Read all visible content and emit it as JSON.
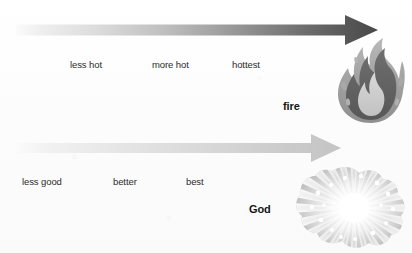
{
  "diagram": {
    "type": "comparison-scales",
    "background_color": "#fdfdfd",
    "width": 412,
    "height": 253,
    "scales": [
      {
        "id": "heat-scale",
        "name": "fire-heat-scale",
        "arrow": {
          "name": "heat-gradient-arrow",
          "direction": "right",
          "x_start": 16,
          "x_tip": 378,
          "y_center": 30,
          "bar_height": 11,
          "tick_count": 18,
          "gradient_from": "#f2f2f2",
          "gradient_to": "#4a4a4a"
        },
        "tick_labels": [
          {
            "text": "less hot",
            "x": 70
          },
          {
            "text": "more hot",
            "x": 152
          },
          {
            "text": "hottest",
            "x": 232
          }
        ],
        "entity": {
          "label": "fire",
          "label_x": 283,
          "label_y": 100,
          "icon": "flame-icon",
          "icon_x": 333,
          "icon_y": 38,
          "icon_width": 74,
          "icon_height": 85
        }
      },
      {
        "id": "goodness-scale",
        "name": "god-goodness-scale",
        "arrow": {
          "name": "goodness-gradient-arrow",
          "direction": "right",
          "x_start": 12,
          "x_tip": 341,
          "y_center": 148,
          "bar_height": 11,
          "tick_count": 18,
          "gradient_from": "#f5f5f5",
          "gradient_to": "#c9c9c9"
        },
        "tick_labels": [
          {
            "text": "less good",
            "x": 22
          },
          {
            "text": "better",
            "x": 113
          },
          {
            "text": "best",
            "x": 186
          }
        ],
        "entity": {
          "label": "God",
          "label_x": 249,
          "label_y": 203,
          "icon": "radiant-burst-icon",
          "icon_x": 291,
          "icon_y": 163,
          "icon_width": 118,
          "icon_height": 88
        }
      }
    ]
  }
}
